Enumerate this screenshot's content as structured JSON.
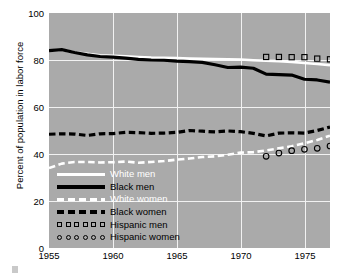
{
  "chart_data": {
    "type": "line",
    "title": "",
    "xlabel": "",
    "ylabel": "Percent of population in labor force",
    "xlim": [
      1955,
      1977
    ],
    "ylim": [
      0,
      100
    ],
    "grid": true,
    "legend_position": "lower-left-inside",
    "xticks": [
      1955,
      1960,
      1965,
      1970,
      1975
    ],
    "yticks": [
      0,
      20,
      40,
      60,
      80,
      100
    ],
    "series": [
      {
        "name": "White men",
        "style": "solid",
        "color": "#ffffff",
        "x": [
          1955,
          1956,
          1957,
          1958,
          1959,
          1960,
          1961,
          1962,
          1963,
          1964,
          1965,
          1966,
          1967,
          1968,
          1969,
          1970,
          1971,
          1972,
          1973,
          1974,
          1975,
          1976,
          1977
        ],
        "values": [
          84.0,
          84.3,
          83.3,
          82.6,
          82.0,
          81.8,
          81.6,
          81.3,
          81.0,
          80.9,
          80.8,
          80.6,
          80.5,
          80.4,
          80.3,
          80.2,
          79.9,
          79.7,
          79.5,
          79.2,
          78.7,
          78.3,
          77.8
        ]
      },
      {
        "name": "Black men",
        "style": "solid",
        "color": "#000000",
        "x": [
          1955,
          1956,
          1957,
          1958,
          1959,
          1960,
          1961,
          1962,
          1963,
          1964,
          1965,
          1966,
          1967,
          1968,
          1969,
          1970,
          1971,
          1972,
          1973,
          1974,
          1975,
          1976,
          1977
        ],
        "values": [
          84.0,
          84.4,
          83.2,
          82.2,
          81.5,
          81.2,
          80.8,
          80.3,
          80.0,
          79.9,
          79.5,
          79.3,
          79.0,
          78.0,
          76.8,
          77.0,
          76.5,
          74.0,
          73.8,
          73.6,
          71.8,
          71.5,
          70.6
        ]
      },
      {
        "name": "White women",
        "style": "dashed",
        "color": "#ffffff",
        "x": [
          1955,
          1956,
          1957,
          1958,
          1959,
          1960,
          1961,
          1962,
          1963,
          1964,
          1965,
          1966,
          1967,
          1968,
          1969,
          1970,
          1971,
          1972,
          1973,
          1974,
          1975,
          1976,
          1977
        ],
        "values": [
          34.0,
          35.9,
          36.6,
          36.6,
          36.4,
          36.5,
          36.8,
          36.3,
          36.6,
          37.0,
          37.6,
          38.1,
          38.7,
          39.0,
          39.7,
          40.6,
          40.8,
          41.5,
          42.4,
          43.3,
          44.6,
          46.0,
          47.8
        ]
      },
      {
        "name": "Black women",
        "style": "dashed",
        "color": "#000000",
        "x": [
          1955,
          1956,
          1957,
          1958,
          1959,
          1960,
          1961,
          1962,
          1963,
          1964,
          1965,
          1966,
          1967,
          1968,
          1969,
          1970,
          1971,
          1972,
          1973,
          1974,
          1975,
          1976,
          1977
        ],
        "values": [
          48.4,
          48.6,
          48.5,
          47.9,
          48.6,
          48.7,
          49.2,
          49.1,
          48.8,
          48.9,
          49.2,
          50.0,
          49.7,
          49.4,
          49.8,
          49.5,
          48.8,
          47.7,
          48.9,
          49.0,
          48.9,
          50.0,
          51.5
        ]
      },
      {
        "name": "Hispanic men",
        "style": "markers",
        "marker": "square",
        "color": "#000000",
        "x": [
          1972,
          1973,
          1974,
          1975,
          1976,
          1977
        ],
        "values": [
          81.3,
          81.3,
          81.2,
          81.2,
          80.6,
          80.3
        ]
      },
      {
        "name": "Hispanic women",
        "style": "markers",
        "marker": "circle",
        "color": "#000000",
        "x": [
          1972,
          1973,
          1974,
          1975,
          1976,
          1977
        ],
        "values": [
          39.0,
          40.4,
          41.4,
          42.0,
          42.4,
          43.4
        ]
      }
    ],
    "legend": [
      {
        "label": "White men",
        "key": "solid-white-line",
        "color": "#ffffff",
        "text_color": "#ffffff"
      },
      {
        "label": "Black men",
        "key": "solid-black-line",
        "color": "#000000",
        "text_color": "#000000"
      },
      {
        "label": "White women",
        "key": "dashed-white-line",
        "color": "#ffffff",
        "text_color": "#ffffff"
      },
      {
        "label": "Black women",
        "key": "dashed-black-line",
        "color": "#000000",
        "text_color": "#000000"
      },
      {
        "label": "Hispanic men",
        "key": "open-square-markers",
        "color": "#000000",
        "text_color": "#000000"
      },
      {
        "label": "Hispanic women",
        "key": "open-circle-markers",
        "color": "#000000",
        "text_color": "#000000"
      }
    ],
    "colors": {
      "plot_background": "#aaaaaa",
      "page_background": "#ffffff",
      "gridline": "#f2f2f2",
      "white_series": "#ffffff",
      "black_series": "#000000"
    }
  }
}
